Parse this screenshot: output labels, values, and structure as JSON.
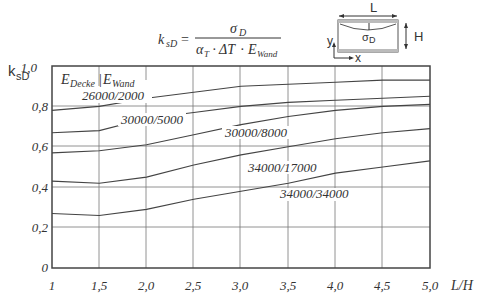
{
  "chart_data": {
    "type": "line",
    "title": "",
    "formula": {
      "lhs": "k",
      "lhs_sub": "sD",
      "numerator": "σ",
      "numerator_sub": "D",
      "denominator": "α",
      "denominator_parts": [
        "α_T",
        "ΔT",
        "E_Wand"
      ]
    },
    "xlabel": "L/H",
    "ylabel": "k_sD",
    "xlim": [
      1,
      5
    ],
    "ylim": [
      0,
      1
    ],
    "grid": true,
    "x_ticks": [
      "1",
      "1,5",
      "2,0",
      "2,5",
      "3,0",
      "3,5",
      "4,0",
      "4,5",
      "5,0"
    ],
    "y_ticks": [
      "0",
      "0,2",
      "0,4",
      "0,6",
      "0,8",
      "1,0"
    ],
    "x": [
      1,
      1.5,
      2,
      2.5,
      3,
      3.5,
      4,
      4.5,
      5
    ],
    "legend_title": "E_Decke / E_Wand",
    "series": [
      {
        "name": "26000/2000",
        "values": [
          0.78,
          0.8,
          0.84,
          0.87,
          0.9,
          0.91,
          0.92,
          0.93,
          0.93
        ]
      },
      {
        "name": "30000/5000",
        "values": [
          0.67,
          0.68,
          0.74,
          0.77,
          0.8,
          0.82,
          0.83,
          0.84,
          0.85
        ]
      },
      {
        "name": "30000/8000",
        "values": [
          0.57,
          0.58,
          0.61,
          0.66,
          0.71,
          0.75,
          0.78,
          0.8,
          0.81
        ]
      },
      {
        "name": "34000/17000",
        "values": [
          0.43,
          0.42,
          0.45,
          0.51,
          0.56,
          0.6,
          0.64,
          0.67,
          0.69
        ]
      },
      {
        "name": "34000/34000",
        "values": [
          0.27,
          0.26,
          0.29,
          0.34,
          0.38,
          0.42,
          0.47,
          0.5,
          0.53
        ]
      }
    ],
    "inset_diagram": {
      "labels": {
        "length": "L",
        "height": "H",
        "stress": "σD",
        "y_axis": "y",
        "x_axis": "x"
      }
    }
  },
  "labels": {
    "y_axis": "k",
    "y_axis_sub": "sD",
    "x_axis": "L/H",
    "legend_e": "E",
    "legend_decke": "Decke",
    "legend_wand": "Wand",
    "series_26000": "26000/2000",
    "series_30000_5000": "30000/5000",
    "series_30000_8000": "30000/8000",
    "series_34000_17000": "34000/17000",
    "series_34000_34000": "34000/34000",
    "formula_k": "k",
    "formula_k_sub": "sD",
    "formula_eq": "=",
    "formula_sigma": "σ",
    "formula_sigma_sub": "D",
    "formula_alpha": "α",
    "formula_alpha_sub": "T",
    "formula_dot1": "·",
    "formula_dt": "ΔT",
    "formula_dot2": "·",
    "formula_e": "E",
    "formula_e_sub": "Wand",
    "inset_L": "L",
    "inset_H": "H",
    "inset_sigma": "σ",
    "inset_sigma_sub": "D",
    "inset_y": "y",
    "inset_x": "x",
    "tick_x_0": "1",
    "tick_x_1": "1,5",
    "tick_x_2": "2,0",
    "tick_x_3": "2,5",
    "tick_x_4": "3,0",
    "tick_x_5": "3,5",
    "tick_x_6": "4,0",
    "tick_x_7": "4,5",
    "tick_x_8": "5,0",
    "tick_y_0": "0",
    "tick_y_1": "0,2",
    "tick_y_2": "0,4",
    "tick_y_3": "0,6",
    "tick_y_4": "0,8",
    "tick_y_5": "1,0"
  }
}
